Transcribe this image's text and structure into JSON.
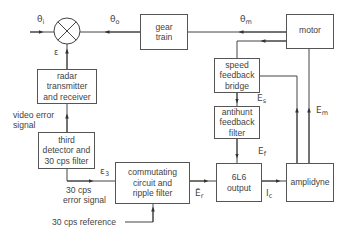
{
  "diagram": {
    "blocks": {
      "gear_train": [
        "gear",
        "train"
      ],
      "motor": [
        "motor"
      ],
      "radar": [
        "radar",
        "transmitter",
        "and receiver"
      ],
      "third_detector": [
        "third",
        "detector and",
        "30 cps filter"
      ],
      "commutating": [
        "commutating",
        "circuit and",
        "ripple filter"
      ],
      "speed_feedback": [
        "speed",
        "feedback",
        "bridge"
      ],
      "antihunt": [
        "antihunt",
        "feedback",
        "filter"
      ],
      "output_6l6": [
        "6L6",
        "output"
      ],
      "amplidyne": [
        "amplidyne"
      ]
    },
    "signals": {
      "theta_i": {
        "base": "θ",
        "sub": "i"
      },
      "theta_o": {
        "base": "θ",
        "sub": "o"
      },
      "theta_m": {
        "base": "θ",
        "sub": "m"
      },
      "epsilon": {
        "base": "ε",
        "sub": ""
      },
      "epsilon_3": {
        "base": "ε",
        "sub": "3"
      },
      "E_s": {
        "base": "E",
        "sub": "s"
      },
      "E_f": {
        "base": "E",
        "sub": "f"
      },
      "E_m": {
        "base": "E",
        "sub": "m"
      },
      "E_r": {
        "base": "Ē",
        "sub": "r"
      },
      "I_c": {
        "base": "I",
        "sub": "c"
      }
    },
    "labels": {
      "video_error": [
        "video error",
        "signal"
      ],
      "error_signal": [
        "30 cps",
        "error signal"
      ],
      "reference": "30 cps reference"
    }
  }
}
